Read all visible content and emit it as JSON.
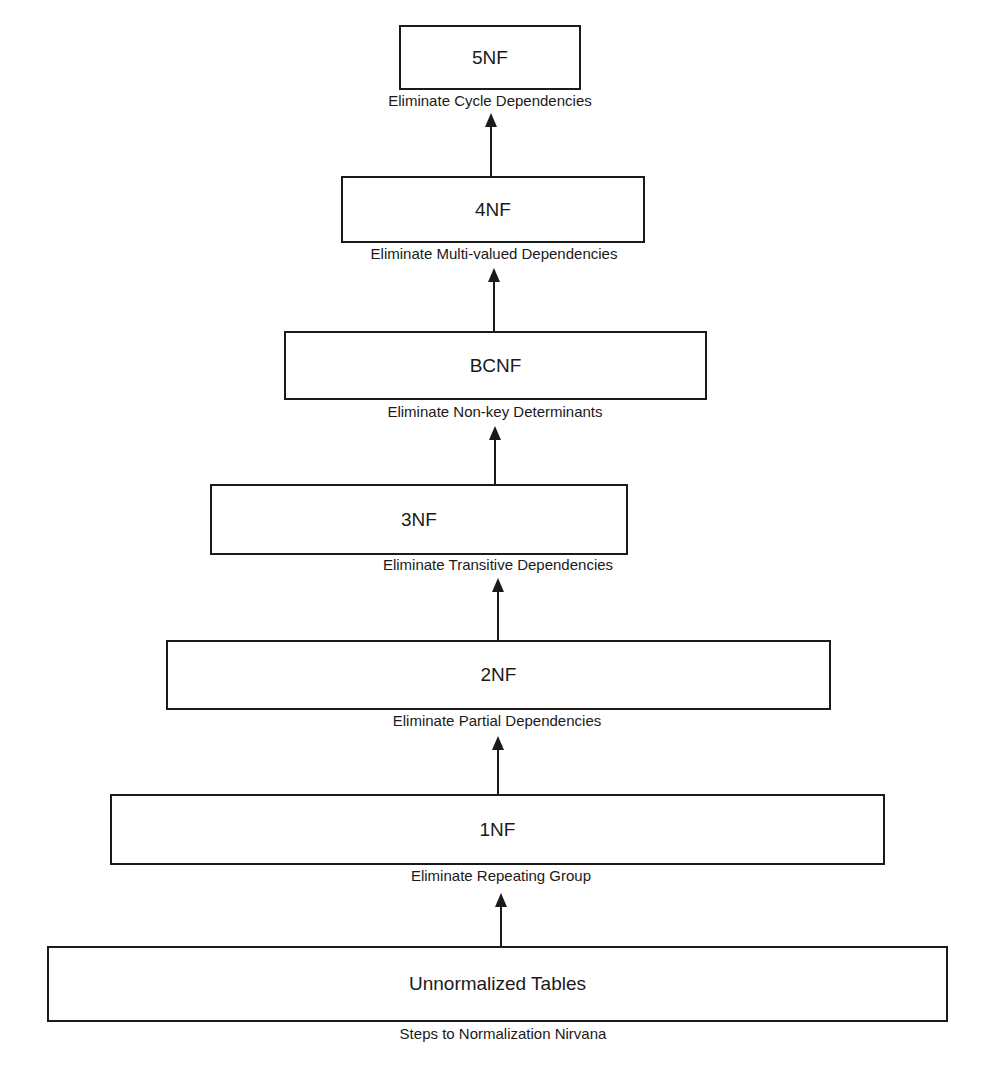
{
  "diagram": {
    "title": "Steps to Normalization Nirvana",
    "steps": [
      {
        "name": "5NF",
        "label": "Eliminate Cycle Dependencies"
      },
      {
        "name": "4NF",
        "label": "Eliminate Multi-valued Dependencies"
      },
      {
        "name": "BCNF",
        "label": "Eliminate Non-key Determinants"
      },
      {
        "name": "3NF",
        "label": "Eliminate Transitive Dependencies"
      },
      {
        "name": "2NF",
        "label": "Eliminate Partial Dependencies"
      },
      {
        "name": "1NF",
        "label": "Eliminate Repeating Group"
      },
      {
        "name": "Unnormalized Tables",
        "label": ""
      }
    ],
    "colors": {
      "stroke": "#1a1a1a",
      "background": "#ffffff"
    }
  }
}
